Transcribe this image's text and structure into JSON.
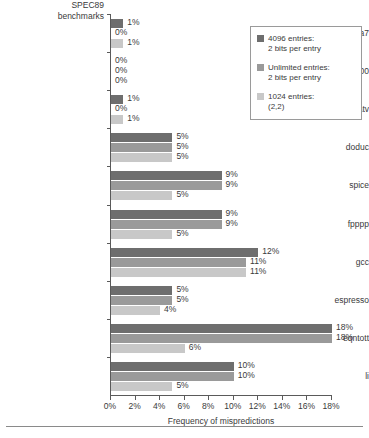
{
  "chart_data": {
    "type": "bar",
    "orientation": "horizontal",
    "title": "",
    "xlabel": "Frequency of mispredictions",
    "ylabel": "SPEC89 benchmarks",
    "xlim": [
      0,
      18
    ],
    "xticks": [
      "0%",
      "2%",
      "4%",
      "6%",
      "8%",
      "10%",
      "12%",
      "14%",
      "16%",
      "18%"
    ],
    "xtick_values": [
      0,
      2,
      4,
      6,
      8,
      10,
      12,
      14,
      16,
      18
    ],
    "grid": false,
    "legend_position": "top-right",
    "categories": [
      "nasa7",
      "matrix300",
      "tomcatv",
      "doduc",
      "spice",
      "fpppp",
      "gcc",
      "espresso",
      "eqntott",
      "li"
    ],
    "series": [
      {
        "name": "4096 entries: 2 bits per entry",
        "color": "#6e6e6e",
        "values": [
          1,
          0,
          1,
          5,
          9,
          9,
          12,
          5,
          18,
          10
        ],
        "labels": [
          "1%",
          "0%",
          "1%",
          "5%",
          "9%",
          "9%",
          "12%",
          "5%",
          "18%",
          "10%"
        ]
      },
      {
        "name": "Unlimited entries: 2 bits per entry",
        "color": "#9a9a9a",
        "values": [
          0,
          0,
          0,
          5,
          9,
          9,
          11,
          5,
          18,
          10
        ],
        "labels": [
          "0%",
          "0%",
          "0%",
          "5%",
          "9%",
          "9%",
          "11%",
          "5%",
          "18%",
          "10%"
        ]
      },
      {
        "name": "1024 entries: (2,2)",
        "color": "#c8c8c8",
        "values": [
          1,
          0,
          1,
          5,
          5,
          5,
          11,
          4,
          6,
          5
        ],
        "labels": [
          "1%",
          "0%",
          "1%",
          "5%",
          "5%",
          "5%",
          "11%",
          "4%",
          "6%",
          "5%"
        ]
      }
    ]
  },
  "legend": {
    "entries": [
      {
        "line1": "4096 entries:",
        "line2": "2 bits per entry",
        "color": "#6e6e6e"
      },
      {
        "line1": "Unlimited entries:",
        "line2": "2 bits per entry",
        "color": "#9a9a9a"
      },
      {
        "line1": "1024 entries:",
        "line2": "(2,2)",
        "color": "#c8c8c8"
      }
    ]
  },
  "axis": {
    "y_title_line1": "SPEC89",
    "y_title_line2": "benchmarks",
    "x_title": "Frequency of mispredictions"
  }
}
